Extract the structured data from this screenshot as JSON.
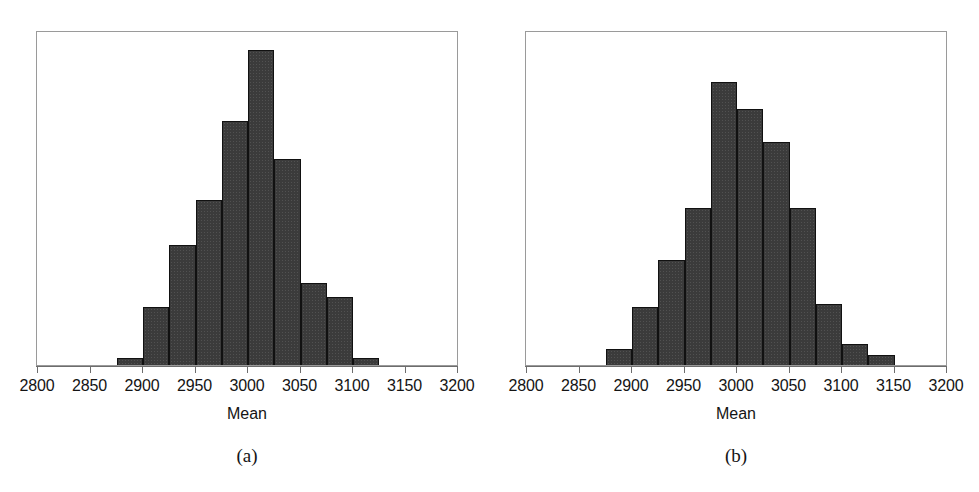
{
  "figure": {
    "background_color": "#ffffff",
    "bar_color": "#3b3b3b",
    "frame_color": "#9a9a9a",
    "axis_color": "#6d6d6d"
  },
  "panels": [
    {
      "id": "panel-a",
      "caption": "(a)",
      "axis_title": "Mean",
      "tick_labels": [
        "2800",
        "2850",
        "2900",
        "2950",
        "3000",
        "3050",
        "3100",
        "3150",
        "3200"
      ],
      "chart_data": {
        "type": "bar",
        "subtype": "histogram",
        "title": "",
        "xlabel": "Mean",
        "ylabel": "",
        "xlim": [
          2800,
          3200
        ],
        "ylim": [
          0,
          320
        ],
        "xticks": [
          2800,
          2850,
          2900,
          2950,
          3000,
          3050,
          3100,
          3150,
          3200
        ],
        "grid": false,
        "legend": null,
        "bin_width": 25,
        "bin_edges": [
          2875,
          2900,
          2925,
          2950,
          2975,
          3000,
          3025,
          3050,
          3075,
          3100,
          3125
        ],
        "categories": [
          "2875-2900",
          "2900-2925",
          "2925-2950",
          "2950-2975",
          "2975-3000",
          "3000-3025",
          "3025-3050",
          "3050-3075",
          "3075-3100",
          "3100-3125"
        ],
        "values": [
          7,
          55,
          115,
          158,
          233,
          301,
          197,
          78,
          65,
          7
        ]
      }
    },
    {
      "id": "panel-b",
      "caption": "(b)",
      "axis_title": "Mean",
      "tick_labels": [
        "2800",
        "2850",
        "2900",
        "2950",
        "3000",
        "3050",
        "3100",
        "3150",
        "3200"
      ],
      "chart_data": {
        "type": "bar",
        "subtype": "histogram",
        "title": "",
        "xlabel": "Mean",
        "ylabel": "",
        "xlim": [
          2800,
          3200
        ],
        "ylim": [
          0,
          320
        ],
        "xticks": [
          2800,
          2850,
          2900,
          2950,
          3000,
          3050,
          3100,
          3150,
          3200
        ],
        "grid": false,
        "legend": null,
        "bin_width": 25,
        "bin_edges": [
          2875,
          2900,
          2925,
          2950,
          2975,
          3000,
          3025,
          3050,
          3075,
          3100,
          3125,
          3150
        ],
        "categories": [
          "2875-2900",
          "2900-2925",
          "2925-2950",
          "2950-2975",
          "2975-3000",
          "3000-3025",
          "3025-3050",
          "3050-3075",
          "3075-3100",
          "3100-3125",
          "3125-3150"
        ],
        "values": [
          15,
          55,
          100,
          150,
          270,
          245,
          213,
          150,
          58,
          20,
          10
        ]
      }
    }
  ],
  "geometry": {
    "panel_a": {
      "frame_left": 36,
      "frame_top": 31,
      "frame_width": 422,
      "frame_height": 335,
      "axis_y": 366,
      "x_2800": 37,
      "x_3200": 457
    },
    "panel_b": {
      "frame_left": 36,
      "frame_top": 31,
      "frame_width": 422,
      "frame_height": 335,
      "axis_y": 366,
      "x_2800": 37,
      "x_3200": 457
    }
  }
}
